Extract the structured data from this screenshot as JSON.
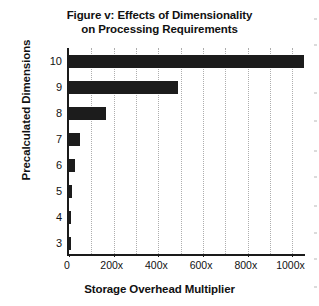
{
  "chart_data": {
    "type": "bar",
    "orientation": "horizontal",
    "title": "Figure v: Effects of Dimensionality on Processing Requirements",
    "title_lines": [
      "Figure v: Effects of Dimensionality",
      "on Processing Requirements"
    ],
    "xlabel": "Storage Overhead Multiplier",
    "ylabel": "Precalculated Dimensions",
    "categories": [
      "10",
      "9",
      "8",
      "7",
      "6",
      "5",
      "4",
      "3"
    ],
    "values": [
      1050,
      487,
      165,
      50,
      25,
      13,
      6,
      4
    ],
    "value_labels": [
      "1050x",
      "487x",
      "165x",
      "50x",
      "25x",
      "13x",
      "6x",
      "4x"
    ],
    "xlim": [
      0,
      1065
    ],
    "xticks": [
      0,
      200,
      400,
      600,
      800,
      1000
    ],
    "xtick_labels": [
      "0",
      "200x",
      "400x",
      "600x",
      "800x",
      "1000x"
    ],
    "ytick_labels": [
      "10",
      "9",
      "8",
      "7",
      "6",
      "5",
      "4",
      "3"
    ],
    "gridlines_x": [
      100,
      200,
      300,
      400,
      500,
      600,
      700,
      800,
      900,
      1000
    ],
    "grid": "minor-vertical-dotted",
    "legend": "none",
    "bar_color": "#1c1c1c",
    "grid_color": "#aeaeae",
    "axis_color": "#1a1a1a",
    "background": "#ffffff"
  }
}
